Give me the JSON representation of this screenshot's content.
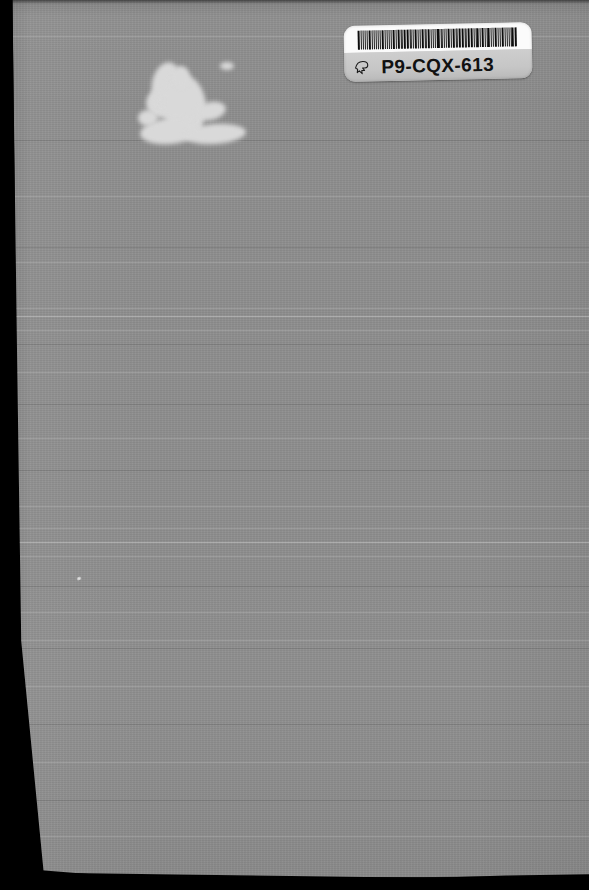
{
  "scan": {
    "kind": "scanned-book-back-cover",
    "width": 589,
    "height": 890,
    "background_color": "#8e8e8e",
    "bed_color": "#000000"
  },
  "label": {
    "name": "library-barcode-label",
    "code": "P9-CQX-613",
    "icon": "pointing-hand-icon",
    "top_color": "#fbfbfb",
    "bottom_color": "#cfcfcf",
    "bar_color": "#0d0d0d",
    "text_color": "#111111",
    "bars": [
      3,
      1,
      1,
      2,
      1,
      3,
      1,
      1,
      2,
      2,
      1,
      3,
      1,
      1,
      1,
      2,
      3,
      1,
      2,
      1,
      1,
      3,
      2,
      1,
      1,
      1,
      3,
      1,
      2,
      2,
      1,
      1,
      3,
      1,
      1,
      2,
      3,
      1,
      1,
      1,
      2,
      3,
      1,
      2,
      1,
      1,
      2,
      3,
      1,
      1,
      3,
      2,
      1,
      1,
      2,
      1,
      3,
      1,
      1,
      2,
      2,
      1,
      3,
      1,
      1,
      3,
      1,
      2,
      1,
      1,
      2,
      3
    ]
  },
  "marks": {
    "scuff": {
      "name": "white-scuff-mark",
      "color": "#dddddd",
      "x": 138,
      "y": 58,
      "width": 104,
      "height": 86
    },
    "speck": {
      "name": "bright-speck",
      "x": 77,
      "y": 577
    },
    "streaks": [
      {
        "y": 36,
        "type": "light"
      },
      {
        "y": 140,
        "type": "dark"
      },
      {
        "y": 196,
        "type": "light"
      },
      {
        "y": 247,
        "type": "dark"
      },
      {
        "y": 262,
        "type": "light"
      },
      {
        "y": 308,
        "type": "light"
      },
      {
        "y": 316,
        "type": "strong"
      },
      {
        "y": 330,
        "type": "light"
      },
      {
        "y": 344,
        "type": "dark"
      },
      {
        "y": 372,
        "type": "light"
      },
      {
        "y": 404,
        "type": "dark"
      },
      {
        "y": 438,
        "type": "light"
      },
      {
        "y": 470,
        "type": "dark"
      },
      {
        "y": 506,
        "type": "light"
      },
      {
        "y": 528,
        "type": "light"
      },
      {
        "y": 542,
        "type": "strong"
      },
      {
        "y": 556,
        "type": "light"
      },
      {
        "y": 586,
        "type": "dark"
      },
      {
        "y": 612,
        "type": "light"
      },
      {
        "y": 640,
        "type": "light"
      },
      {
        "y": 648,
        "type": "dark"
      },
      {
        "y": 686,
        "type": "light"
      },
      {
        "y": 724,
        "type": "dark"
      },
      {
        "y": 762,
        "type": "light"
      },
      {
        "y": 800,
        "type": "dark"
      },
      {
        "y": 836,
        "type": "light"
      }
    ]
  }
}
